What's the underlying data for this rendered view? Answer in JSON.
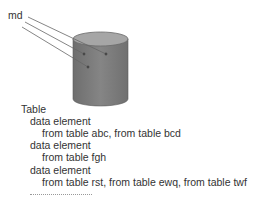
{
  "label": "md",
  "cylinder": {
    "fill": "#808080",
    "top_fill": "#a8a8a8",
    "stroke": "#5a5a5a"
  },
  "outline": {
    "title": "Table",
    "items": [
      {
        "element": "data element",
        "sources": "from table abc, from table bcd"
      },
      {
        "element": "data element",
        "sources": "from table fgh"
      },
      {
        "element": "data element",
        "sources": "from table rst, from table ewq, from table twf"
      }
    ],
    "continuation": "..................."
  }
}
